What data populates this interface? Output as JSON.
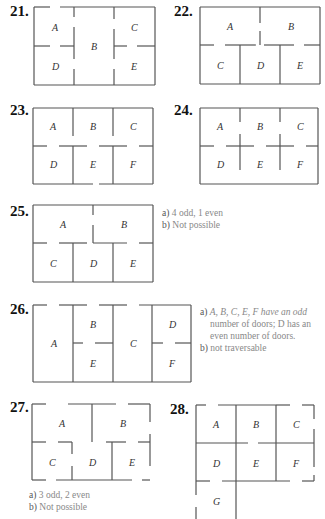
{
  "problems": [
    {
      "number": "21.",
      "rooms": [
        "A",
        "B",
        "C",
        "D",
        "E"
      ]
    },
    {
      "number": "22.",
      "rooms": [
        "A",
        "B",
        "C",
        "D",
        "E"
      ]
    },
    {
      "number": "23.",
      "rooms": [
        "A",
        "B",
        "C",
        "D",
        "E",
        "F"
      ]
    },
    {
      "number": "24.",
      "rooms": [
        "A",
        "B",
        "C",
        "D",
        "E",
        "F"
      ]
    },
    {
      "number": "25.",
      "rooms": [
        "A",
        "B",
        "C",
        "D",
        "E"
      ],
      "answer": {
        "a_label": "a)",
        "a_text": "4 odd, 1 even",
        "b_label": "b)",
        "b_text": "Not possible"
      }
    },
    {
      "number": "26.",
      "rooms": [
        "A",
        "B",
        "C",
        "D",
        "E",
        "F"
      ],
      "answer": {
        "a_label": "a)",
        "a_line1": "A, B, C, E, F have an odd",
        "a_line2": "number of doors; D has an",
        "a_line3": "even number of doors.",
        "b_label": "b)",
        "b_text": "not traversable"
      }
    },
    {
      "number": "27.",
      "rooms": [
        "A",
        "B",
        "C",
        "D",
        "E"
      ],
      "answer": {
        "a_label": "a)",
        "a_text": "3 odd, 2 even",
        "b_label": "b)",
        "b_text": "Not possible"
      }
    },
    {
      "number": "28.",
      "rooms": [
        "A",
        "B",
        "C",
        "D",
        "E",
        "F",
        "G"
      ]
    }
  ]
}
